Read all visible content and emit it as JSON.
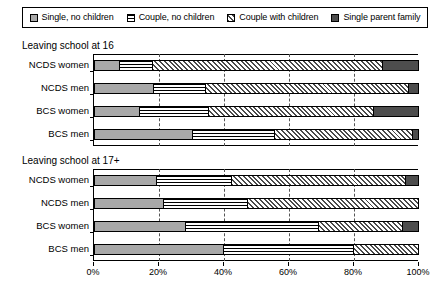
{
  "legend": {
    "items": [
      {
        "label": "Single, no children",
        "key": "single",
        "pattern": "solid-grey"
      },
      {
        "label": "Couple, no children",
        "key": "couple",
        "pattern": "horizontal-stripes"
      },
      {
        "label": "Couple with children",
        "key": "couple_kids",
        "pattern": "diagonal-hatch"
      },
      {
        "label": "Single parent family",
        "key": "single_parent",
        "pattern": "solid-dark"
      }
    ]
  },
  "panels": [
    {
      "title": "Leaving school at 16"
    },
    {
      "title": "Leaving school at 17+"
    }
  ],
  "axis": {
    "ticks": [
      "0%",
      "20%",
      "40%",
      "60%",
      "80%",
      "100%"
    ],
    "values": [
      0,
      20,
      40,
      60,
      80,
      100
    ]
  },
  "chart_data": {
    "type": "bar",
    "orientation": "horizontal",
    "stacked": true,
    "stack_total": 100,
    "title": "",
    "xlabel": "",
    "ylabel": "",
    "xlim": [
      0,
      100
    ],
    "grid": true,
    "legend_position": "top",
    "series": [
      {
        "name": "Single, no children",
        "key": "single"
      },
      {
        "name": "Couple, no children",
        "key": "couple"
      },
      {
        "name": "Couple with children",
        "key": "couple_kids"
      },
      {
        "name": "Single parent family",
        "key": "single_parent"
      }
    ],
    "panels": [
      {
        "title": "Leaving school at 16",
        "categories": [
          "NCDS women",
          "NCDS men",
          "BCS women",
          "BCS men"
        ],
        "rows": [
          {
            "category": "NCDS women",
            "values": [
              7.5,
              10.0,
              71.5,
              11.0
            ]
          },
          {
            "category": "NCDS men",
            "values": [
              18.0,
              16.0,
              63.0,
              3.0
            ]
          },
          {
            "category": "BCS women",
            "values": [
              13.5,
              21.5,
              51.0,
              14.0
            ]
          },
          {
            "category": "BCS men",
            "values": [
              30.0,
              25.5,
              42.5,
              2.0
            ]
          }
        ]
      },
      {
        "title": "Leaving school at 17+",
        "categories": [
          "NCDS women",
          "NCDS men",
          "BCS women",
          "BCS men"
        ],
        "rows": [
          {
            "category": "NCDS women",
            "values": [
              19.0,
              23.0,
              54.0,
              4.0
            ]
          },
          {
            "category": "NCDS men",
            "values": [
              21.0,
              26.0,
              53.0,
              0.0
            ]
          },
          {
            "category": "BCS women",
            "values": [
              28.0,
              41.0,
              26.0,
              5.0
            ]
          },
          {
            "category": "BCS men",
            "values": [
              39.5,
              40.5,
              20.0,
              0.0
            ]
          }
        ]
      }
    ]
  }
}
